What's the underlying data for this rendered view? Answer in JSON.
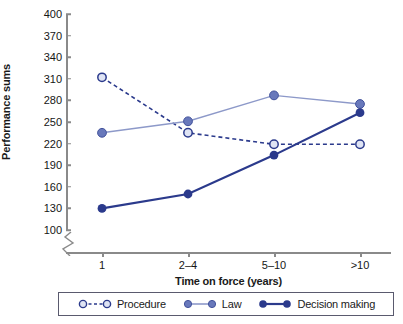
{
  "chart_data": {
    "type": "line",
    "title": "",
    "xlabel": "Time on force (years)",
    "ylabel": "Performance sums",
    "categories": [
      "1",
      "2–4",
      "5–10",
      ">10"
    ],
    "yticks": [
      100,
      130,
      160,
      190,
      220,
      250,
      280,
      310,
      340,
      370,
      400
    ],
    "ylim": [
      100,
      400
    ],
    "ytick_step": 30,
    "axis_break": true,
    "grid": false,
    "legend_position": "bottom",
    "series": [
      {
        "name": "Procedure",
        "values": [
          312,
          235,
          219,
          219
        ],
        "color": "#2b3a8c",
        "marker_fill": "#dfe4f4",
        "line_style": "dashed",
        "line_width": 1.6,
        "marker": "open-circle"
      },
      {
        "name": "Law",
        "values": [
          235,
          251,
          287,
          275
        ],
        "color": "#8d99c9",
        "marker_fill": "#6878bb",
        "line_style": "solid",
        "line_width": 1.4,
        "marker": "filled-circle"
      },
      {
        "name": "Decision making",
        "values": [
          130,
          150,
          204,
          263
        ],
        "color": "#2b3a8c",
        "marker_fill": "#2b3a8c",
        "line_style": "solid",
        "line_width": 2.2,
        "marker": "filled-circle"
      }
    ]
  },
  "axis": {
    "color": "#8a8a8a",
    "tick_label_color": "#161616"
  },
  "legend": {
    "border_color": "#5a5a6e",
    "items": [
      {
        "label": "Procedure"
      },
      {
        "label": "Law"
      },
      {
        "label": "Decision making"
      }
    ]
  }
}
